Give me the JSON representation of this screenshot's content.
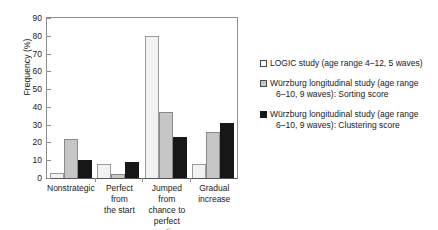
{
  "chart_data": {
    "type": "bar",
    "title": "",
    "xlabel": "",
    "ylabel": "Frequency (%)",
    "ylim": [
      0,
      90
    ],
    "ytick_step": 10,
    "yticks": [
      90,
      80,
      70,
      60,
      50,
      40,
      30,
      20,
      10,
      0
    ],
    "grid": false,
    "legend_position": "right",
    "categories": [
      "Nonstrategic",
      "Perfect from the start",
      "Jumped from chance to perfect sorting",
      "Gradual increase"
    ],
    "category_lines": [
      [
        "Nonstrategic"
      ],
      [
        "Perfect from",
        "the start"
      ],
      [
        "Jumped from",
        "chance to",
        "perfect sorting"
      ],
      [
        "Gradual",
        "increase"
      ]
    ],
    "series": [
      {
        "name": "LOGIC study (age range 4–12, 5 waves)",
        "color": "#f2f2f2",
        "values": [
          3,
          8,
          80,
          8
        ]
      },
      {
        "name": "Würzburg longitudinal study (age range 6–10, 9 waves): Sorting score",
        "color": "#c6c6c6",
        "values": [
          22,
          2,
          37,
          26
        ]
      },
      {
        "name": "Würzburg longitudinal study (age range 6–10, 9 waves): Clustering score",
        "color": "#171717",
        "values": [
          10,
          9,
          23,
          31
        ]
      }
    ]
  },
  "legend": {
    "entries": [
      {
        "line1": "LOGIC study (age range 4–12, 5 waves)",
        "line2": ""
      },
      {
        "line1": "Würzburg longitudinal study (age range",
        "line2": "6–10, 9 waves): Sorting score"
      },
      {
        "line1": "Würzburg longitudinal study (age range",
        "line2": "6–10, 9 waves): Clustering score"
      }
    ]
  }
}
